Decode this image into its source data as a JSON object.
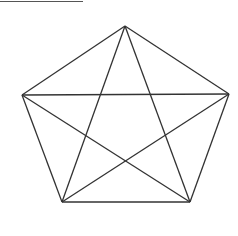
{
  "diagram": {
    "type": "pentagram-in-pentagon",
    "stroke_color": "#333333",
    "vertices": [
      {
        "name": "top",
        "x": 125,
        "y": 26
      },
      {
        "name": "right",
        "x": 229,
        "y": 94
      },
      {
        "name": "bottom-right",
        "x": 190,
        "y": 202
      },
      {
        "name": "bottom-left",
        "x": 62,
        "y": 202
      },
      {
        "name": "left",
        "x": 22,
        "y": 95
      }
    ]
  },
  "caption": ""
}
